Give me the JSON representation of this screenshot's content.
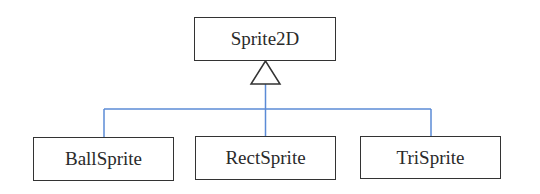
{
  "diagram": {
    "type": "uml-class-inheritance",
    "parent": {
      "label": "Sprite2D"
    },
    "children": [
      {
        "label": "BallSprite"
      },
      {
        "label": "RectSprite"
      },
      {
        "label": "TriSprite"
      }
    ],
    "colors": {
      "connector": "#5b8bd6",
      "box_border": "#333333",
      "text": "#2a2a2a"
    }
  }
}
